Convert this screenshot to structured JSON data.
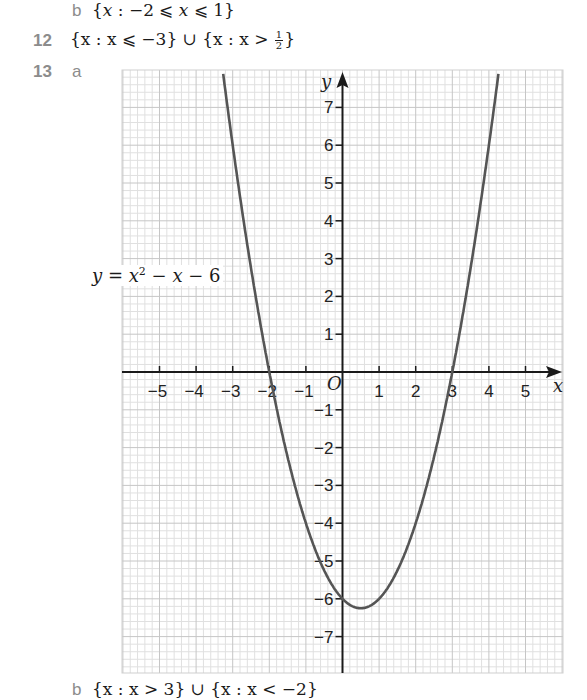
{
  "answers": {
    "q11b": {
      "label": "b",
      "text_prefix": "{",
      "var": "x",
      "body": " : −2 ⩽ ",
      "var2": "x",
      "body2": " ⩽ 1}"
    },
    "q12": {
      "number": "12",
      "part1": "{x : x ⩽ −3} ∪ {x : x > ",
      "frac_num": "1",
      "frac_den": "2",
      "part2": "}"
    },
    "q13": {
      "number": "13",
      "label_a": "a",
      "label_b": "b",
      "cutoff_text": "{x : x > 3} ∪ {x : x < −2}"
    }
  },
  "chart_data": {
    "type": "line",
    "title": "",
    "equation_label": "y = x² − x − 6",
    "function": "x^2 - x - 6",
    "xlabel": "x",
    "ylabel": "y",
    "origin_label": "O",
    "xlim": [
      -6,
      6
    ],
    "ylim": [
      -8,
      8
    ],
    "grid": true,
    "minor_grid_per_unit": 5,
    "x_ticks": [
      -5,
      -4,
      -3,
      -2,
      -1,
      1,
      2,
      3,
      4,
      5
    ],
    "y_ticks": [
      -7,
      -6,
      -5,
      -4,
      -3,
      -2,
      -1,
      1,
      2,
      3,
      4,
      5,
      6,
      7
    ],
    "x_tick_labels": [
      "−5",
      "−4",
      "−3",
      "−2",
      "−1",
      "1",
      "2",
      "3",
      "4",
      "5"
    ],
    "y_tick_labels": [
      "−7",
      "−6",
      "−5",
      "−4",
      "−3",
      "−2",
      "−1",
      "1",
      "2",
      "3",
      "4",
      "5",
      "6",
      "7"
    ],
    "key_points": {
      "roots": [
        -2,
        3
      ],
      "y_intercept": -6,
      "vertex": [
        0.5,
        -6.25
      ]
    },
    "series": [
      {
        "name": "y = x^2 - x - 6",
        "x": [
          -3.27,
          -3,
          -2.5,
          -2,
          -1.5,
          -1,
          -0.5,
          0,
          0.5,
          1,
          1.5,
          2,
          2.5,
          3,
          3.5,
          4,
          4.27
        ],
        "values": [
          8.0,
          6,
          2.75,
          0,
          -2.25,
          -4,
          -5.25,
          -6,
          -6.25,
          -6,
          -5.25,
          -4,
          -2.25,
          0,
          2.75,
          6,
          8.0
        ]
      }
    ],
    "colors": {
      "curve": "#555555",
      "axis": "#1a1a1a",
      "grid_minor": "#e0e0e0",
      "grid_major": "#c6c6c6"
    }
  }
}
